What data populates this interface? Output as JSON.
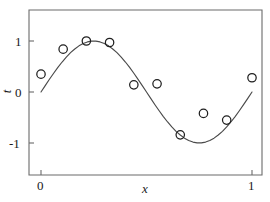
{
  "figure": {
    "background_color": "#ffffff",
    "axis_color": "#6b6b6b",
    "curve_color": "#4a4a4a",
    "marker_color": "#1f1f1f"
  },
  "axes": {
    "xlabel": "x",
    "ylabel": "t",
    "x_ticks": [
      {
        "value": 0,
        "label": "0"
      },
      {
        "value": 1,
        "label": "1"
      }
    ],
    "y_ticks": [
      {
        "value": 1,
        "label": "1"
      },
      {
        "value": 0,
        "label": "0"
      },
      {
        "value": -1,
        "label": "-1"
      }
    ]
  },
  "chart_data": {
    "type": "scatter",
    "title": "",
    "subtitle": "",
    "xlabel": "x",
    "ylabel": "t",
    "xlim": [
      -0.06,
      1.06
    ],
    "ylim": [
      -1.42,
      1.42
    ],
    "grid": false,
    "legend": null,
    "annotations": [],
    "series": [
      {
        "name": "sin(2*pi*x)",
        "type": "line",
        "color": "#4a4a4a",
        "x": [
          0,
          0.02,
          0.04,
          0.06,
          0.08,
          0.1,
          0.12,
          0.14,
          0.16,
          0.18,
          0.2,
          0.22,
          0.24,
          0.26,
          0.28,
          0.3,
          0.32,
          0.34,
          0.36,
          0.38,
          0.4,
          0.42,
          0.44,
          0.46,
          0.48,
          0.5,
          0.52,
          0.54,
          0.56,
          0.58,
          0.6,
          0.62,
          0.64,
          0.66,
          0.68,
          0.7,
          0.72,
          0.74,
          0.76,
          0.78,
          0.8,
          0.82,
          0.84,
          0.86,
          0.88,
          0.9,
          0.92,
          0.94,
          0.96,
          0.98,
          1
        ],
        "y": [
          0,
          0.125,
          0.249,
          0.368,
          0.482,
          0.588,
          0.685,
          0.771,
          0.844,
          0.905,
          0.951,
          0.982,
          0.998,
          0.998,
          0.982,
          0.951,
          0.905,
          0.844,
          0.771,
          0.685,
          0.588,
          0.482,
          0.368,
          0.249,
          0.125,
          0,
          -0.125,
          -0.249,
          -0.368,
          -0.482,
          -0.588,
          -0.685,
          -0.771,
          -0.844,
          -0.905,
          -0.951,
          -0.982,
          -0.998,
          -0.998,
          -0.982,
          -0.951,
          -0.905,
          -0.844,
          -0.771,
          -0.685,
          -0.588,
          -0.482,
          -0.368,
          -0.249,
          -0.125,
          0
        ]
      },
      {
        "name": "observed data",
        "type": "scatter",
        "marker": "open-circle",
        "color": "#1f1f1f",
        "x": [
          0.0,
          0.105,
          0.215,
          0.325,
          0.44,
          0.55,
          0.66,
          0.77,
          0.88,
          1.0
        ],
        "y": [
          0.35,
          0.84,
          1.0,
          0.97,
          0.14,
          0.16,
          -0.84,
          -0.42,
          -0.55,
          0.28
        ]
      }
    ]
  }
}
